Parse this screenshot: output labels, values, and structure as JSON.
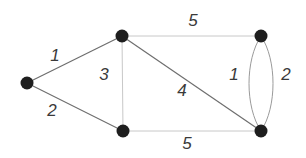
{
  "graph": {
    "nodes": [
      {
        "id": "A",
        "x": 27,
        "y": 83
      },
      {
        "id": "B",
        "x": 122,
        "y": 36
      },
      {
        "id": "C",
        "x": 123,
        "y": 131
      },
      {
        "id": "D",
        "x": 261,
        "y": 36
      },
      {
        "id": "E",
        "x": 261,
        "y": 131
      }
    ],
    "edges": [
      {
        "from": "A",
        "to": "B",
        "weight": "1",
        "label_x": 55,
        "label_y": 55,
        "color": "#6e6e6e",
        "shape": "line"
      },
      {
        "from": "A",
        "to": "C",
        "weight": "2",
        "label_x": 52,
        "label_y": 110,
        "color": "#6e6e6e",
        "shape": "line"
      },
      {
        "from": "B",
        "to": "C",
        "weight": "3",
        "label_x": 104,
        "label_y": 74,
        "color": "#c8c8c8",
        "shape": "line"
      },
      {
        "from": "B",
        "to": "E",
        "weight": "4",
        "label_x": 182,
        "label_y": 90,
        "color": "#6e6e6e",
        "shape": "line"
      },
      {
        "from": "B",
        "to": "D",
        "weight": "5",
        "label_x": 193,
        "label_y": 20,
        "color": "#c8c8c8",
        "shape": "line"
      },
      {
        "from": "C",
        "to": "E",
        "weight": "5",
        "label_x": 187,
        "label_y": 143,
        "color": "#c8c8c8",
        "shape": "line"
      },
      {
        "from": "D",
        "to": "E",
        "weight": "1",
        "label_x": 234,
        "label_y": 74,
        "color": "#9a9a9a",
        "shape": "arc-left"
      },
      {
        "from": "D",
        "to": "E",
        "weight": "2",
        "label_x": 286,
        "label_y": 74,
        "color": "#9a9a9a",
        "shape": "arc-right"
      }
    ]
  },
  "labels": {
    "w_ab": "1",
    "w_ac": "2",
    "w_bc": "3",
    "w_be": "4",
    "w_bd": "5",
    "w_ce": "5",
    "w_de1": "1",
    "w_de2": "2"
  },
  "colors": {
    "node": "#1e1e1e",
    "edge_dark": "#6e6e6e",
    "edge_light": "#c8c8c8",
    "edge_arc": "#9a9a9a",
    "label": "#3a3a3a"
  }
}
